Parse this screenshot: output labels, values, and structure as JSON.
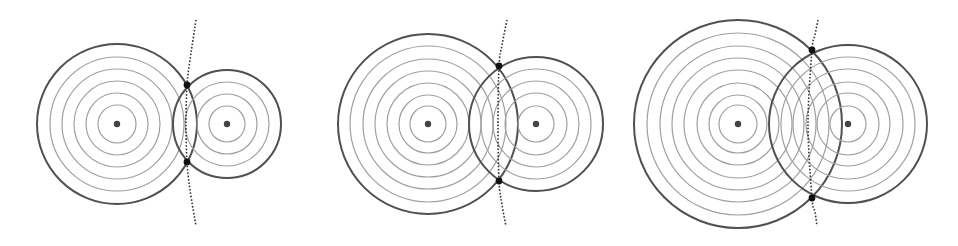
{
  "figure": {
    "width": 958,
    "height": 246,
    "colors": {
      "background": "#ffffff",
      "outer_circle": "#505050",
      "ring": "#a0a0a0",
      "center_dot": "#444444",
      "intersection_dot": "#111111",
      "dotted_curve": "#333333"
    },
    "panels": [
      {
        "id": "panel-1",
        "sources": [
          {
            "cx": 117,
            "cy": 124,
            "outer_r": 80,
            "rings": [
              19,
              31,
              43,
              55,
              67
            ]
          },
          {
            "cx": 227,
            "cy": 124,
            "outer_r": 54,
            "rings": [
              18,
              30,
              42
            ]
          }
        ],
        "intersections": [
          {
            "x": 187,
            "y": 85
          },
          {
            "x": 187,
            "y": 162
          }
        ],
        "curve": [
          [
            196,
            20
          ],
          [
            190,
            60
          ],
          [
            187,
            85
          ],
          [
            186,
            124
          ],
          [
            187,
            162
          ],
          [
            190,
            190
          ],
          [
            196,
            226
          ]
        ]
      },
      {
        "id": "panel-2",
        "sources": [
          {
            "cx": 428,
            "cy": 124,
            "outer_r": 90,
            "rings": [
              18,
              29,
              41,
              53,
              65,
              78
            ]
          },
          {
            "cx": 536,
            "cy": 124,
            "outer_r": 67,
            "rings": [
              18,
              31,
              43,
              55
            ]
          }
        ],
        "intersections": [
          {
            "x": 499,
            "y": 66
          },
          {
            "x": 499,
            "y": 181
          }
        ],
        "curve": [
          [
            507,
            20
          ],
          [
            502,
            45
          ],
          [
            499,
            66
          ],
          [
            498,
            124
          ],
          [
            499,
            181
          ],
          [
            502,
            205
          ],
          [
            506,
            226
          ]
        ]
      },
      {
        "id": "panel-3",
        "sources": [
          {
            "cx": 738,
            "cy": 124,
            "outer_r": 104,
            "rings": [
              19,
              29,
              41,
              54,
              66,
              78,
              91
            ]
          },
          {
            "cx": 848,
            "cy": 124,
            "outer_r": 79,
            "rings": [
              18,
              31,
              42,
              55,
              67
            ]
          }
        ],
        "intersections": [
          {
            "x": 812,
            "y": 50
          },
          {
            "x": 812,
            "y": 198
          }
        ],
        "curve": [
          [
            818,
            20
          ],
          [
            815,
            35
          ],
          [
            812,
            50
          ],
          [
            808,
            124
          ],
          [
            812,
            198
          ],
          [
            815,
            212
          ],
          [
            817,
            226
          ]
        ]
      }
    ]
  }
}
